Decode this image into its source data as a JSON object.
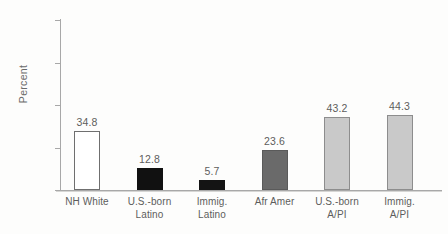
{
  "chart_data": {
    "type": "bar",
    "title": "",
    "subtitle": "",
    "xlabel": "",
    "ylabel": "Percent",
    "ylim": [
      0,
      100
    ],
    "yticks": [
      0,
      25,
      50,
      75,
      100
    ],
    "ytick_labels": [
      "0",
      "25",
      "50",
      "75",
      "100"
    ],
    "grid": false,
    "legend": false,
    "categories": [
      "NH White",
      "U.S.-born Latino",
      "Immig. Latino",
      "Afr Amer",
      "U.S.-born A/PI",
      "Immig. A/PI"
    ],
    "values": [
      34.8,
      12.8,
      5.7,
      23.6,
      43.2,
      44.3
    ],
    "data_labels": [
      "34.8",
      "12.8",
      "5.7",
      "23.6",
      "43.2",
      "44.3"
    ],
    "bars": [
      {
        "category_line1": "NH White",
        "category_line2": "",
        "value": 34.8,
        "label": "34.8",
        "fill": "#ffffff",
        "stroke": "#6f6f6f"
      },
      {
        "category_line1": "U.S.-born",
        "category_line2": "Latino",
        "value": 12.8,
        "label": "12.8",
        "fill": "#111111",
        "stroke": "#111111"
      },
      {
        "category_line1": "Immig.",
        "category_line2": "Latino",
        "value": 5.7,
        "label": "5.7",
        "fill": "#141414",
        "stroke": "#141414"
      },
      {
        "category_line1": "Afr Amer",
        "category_line2": "",
        "value": 23.6,
        "label": "23.6",
        "fill": "#6a6a6a",
        "stroke": "#5a5a5a"
      },
      {
        "category_line1": "U.S.-born",
        "category_line2": "A/PI",
        "value": 43.2,
        "label": "43.2",
        "fill": "#c9c9c9",
        "stroke": "#8d8d8d"
      },
      {
        "category_line1": "Immig.",
        "category_line2": "A/PI",
        "value": 44.3,
        "label": "44.3",
        "fill": "#c9c9c9",
        "stroke": "#8d8d8d"
      }
    ]
  },
  "colors": {
    "background": "#fdfdfc",
    "axis": "#a8a8a8",
    "text": "#5d5d5d",
    "tick_text": "#6a6a6a"
  }
}
